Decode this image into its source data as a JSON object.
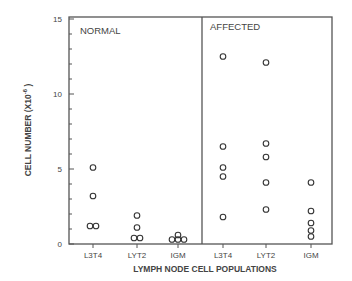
{
  "chart_data": {
    "type": "scatter",
    "title": "",
    "xlabel": "LYMPH NODE CELL POPULATIONS",
    "ylabel": "CELL NUMBER (X10",
    "ylabel_exp": "-6",
    "ylabel_close": " )",
    "ylim": [
      0,
      15
    ],
    "yticks": [
      0,
      5,
      10,
      15
    ],
    "ytick_labels": [
      "0",
      "5",
      "10",
      "15"
    ],
    "minor_tick_step": 1,
    "grid": false,
    "legend": null,
    "panels": [
      {
        "label": "NORMAL",
        "categories": [
          "L3T4",
          "LYT2",
          "IGM"
        ],
        "points": {
          "L3T4": [
            5.1,
            3.2,
            1.2,
            1.2
          ],
          "LYT2": [
            1.9,
            1.1,
            0.4,
            0.4
          ],
          "IGM": [
            0.6,
            0.3,
            0.3,
            0.3
          ]
        }
      },
      {
        "label": "AFFECTED",
        "categories": [
          "L3T4",
          "LYT2",
          "IGM"
        ],
        "points": {
          "L3T4": [
            12.5,
            6.5,
            5.1,
            4.5,
            1.8
          ],
          "LYT2": [
            12.1,
            6.7,
            5.8,
            4.1,
            2.3
          ],
          "IGM": [
            4.1,
            2.2,
            1.4,
            0.9,
            0.5
          ]
        }
      }
    ]
  }
}
